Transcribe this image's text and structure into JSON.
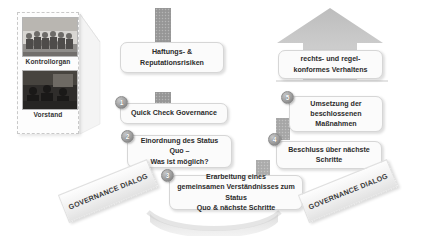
{
  "diagram": {
    "colors": {
      "band": "#9b9b9b",
      "box_fill": "#fbfbfb",
      "box_border": "#d6d6d6",
      "badge": "#8c8c8c",
      "text": "#2b2b2b"
    }
  },
  "actors": {
    "panel_label": "Organe",
    "items": [
      {
        "label": "Kontrollorgan",
        "photo": "group-photo-supervisory-board"
      },
      {
        "label": "Vorstand",
        "photo": "group-photo-management-board"
      }
    ]
  },
  "goals": {
    "left": {
      "lines": [
        "Haftungs- &",
        "Reputationsrisiken"
      ]
    },
    "right": {
      "lines": [
        "rechts- und regel-",
        "konformes Verhaltens"
      ]
    }
  },
  "steps": [
    {
      "number": "1",
      "lines": [
        "Quick Check Governance"
      ],
      "column": "left"
    },
    {
      "number": "2",
      "lines": [
        "Einordnung des Status",
        "Quo –",
        "Was ist möglich?"
      ],
      "column": "left"
    },
    {
      "number": "3",
      "lines": [
        "Erarbeitung eines",
        "gemeinsamen Verständnisses zum Status",
        "Quo & nächste Schritte"
      ],
      "column": "center"
    },
    {
      "number": "4",
      "lines": [
        "Beschluss über nächste",
        "Schritte"
      ],
      "column": "right"
    },
    {
      "number": "5",
      "lines": [
        "Umsetzung der",
        "beschlossenen",
        "Maßnahmen"
      ],
      "column": "right"
    }
  ],
  "ribbons": {
    "left": {
      "line1": "GOVERNANCE",
      "line2": "DIALOG"
    },
    "right": {
      "line1": "GOVERNANCE",
      "line2": "DIALOG"
    }
  }
}
